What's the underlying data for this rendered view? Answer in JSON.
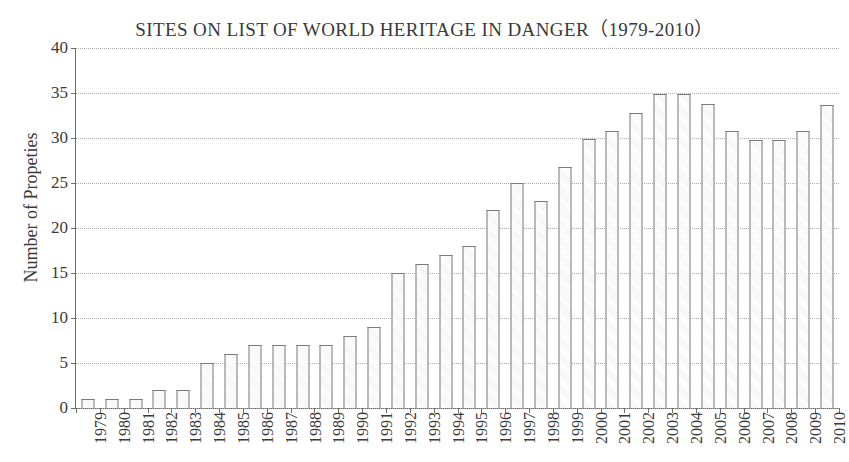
{
  "chart_data": {
    "type": "bar",
    "title": "SITES ON LIST OF WORLD HERITAGE IN DANGER（1979-2010）",
    "xlabel": "",
    "ylabel": "Number of Propeties",
    "ylim": [
      0,
      40
    ],
    "yticks": [
      0,
      5,
      10,
      15,
      20,
      25,
      30,
      35,
      40
    ],
    "grid": true,
    "legend": null,
    "categories": [
      "1979",
      "1980",
      "1981",
      "1982",
      "1983",
      "1984",
      "1985",
      "1986",
      "1987",
      "1988",
      "1989",
      "1990",
      "1991",
      "1992",
      "1993",
      "1994",
      "1995",
      "1996",
      "1997",
      "1998",
      "1999",
      "2000",
      "2001",
      "2002",
      "2003",
      "2004",
      "2005",
      "2006",
      "2007",
      "2008",
      "2009",
      "2010"
    ],
    "values": [
      1,
      1,
      1,
      2,
      2,
      5,
      6,
      7,
      7,
      7,
      7,
      8,
      9,
      15,
      16,
      17,
      18,
      22,
      25,
      23,
      26.8,
      29.9,
      30.8,
      32.8,
      34.9,
      34.9,
      33.8,
      30.8,
      29.8,
      29.8,
      30.8,
      33.7
    ],
    "bar_face_color": "#f7f7f7",
    "bar_edge_color": "#7b7b7b",
    "grid_color": "#a9a9a9",
    "axis_color": "#6d6d6d",
    "text_color": "#3a3a3a"
  }
}
